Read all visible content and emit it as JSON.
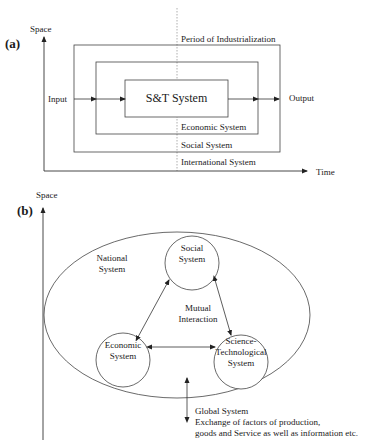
{
  "panel_a": {
    "label": "(a)",
    "y_axis": "Space",
    "x_axis": "Time",
    "top_label": "Period of Industrialization",
    "input": "Input",
    "output": "Output",
    "core_box": "S&T System",
    "layers": [
      "Economic System",
      "Social System",
      "International System"
    ]
  },
  "panel_b": {
    "label": "(b)",
    "y_axis": "Space",
    "ellipse_label": [
      "National",
      "System"
    ],
    "center_label": [
      "Mutual",
      "Interaction"
    ],
    "nodes": {
      "social": [
        "Social",
        "System"
      ],
      "economic": [
        "Economic",
        "System"
      ],
      "scitech": [
        "Science-",
        "Technological",
        "System"
      ]
    },
    "global": [
      "Global System",
      "Exchange of factors of production,",
      "goods and Service as well as information etc."
    ]
  },
  "colors": {
    "line": "#333333",
    "dotted": "#888888",
    "text": "#1a1a1a"
  }
}
